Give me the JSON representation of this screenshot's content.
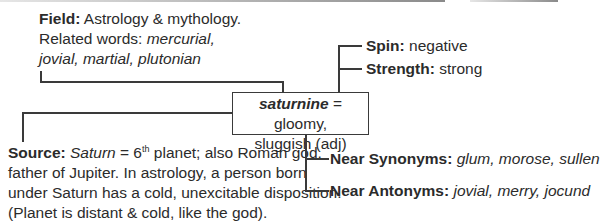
{
  "diagram": {
    "center": {
      "word": "saturnine",
      "equals": " = ",
      "definition_line1": "gloomy,",
      "definition_line2": "sluggish (adj)"
    },
    "field": {
      "label": "Field:",
      "text": " Astrology & mythology.",
      "related_label": "Related words: ",
      "related_line1": "mercurial,",
      "related_line2": "jovial, martial, plutonian"
    },
    "spin": {
      "label": "Spin:",
      "value": " negative"
    },
    "strength": {
      "label": "Strength:",
      "value": " strong"
    },
    "source": {
      "label": "Source:",
      "saturn": "Saturn",
      "eq": " = 6",
      "sup": "th",
      "line1_rest": " planet; also Roman god,",
      "line2": "father of Jupiter. In astrology, a person born",
      "line3": "under Saturn has a cold, unexcitable disposition.",
      "line4": "(Planet is distant & cold, like the god)."
    },
    "near_synonyms": {
      "label": "Near Synonyms:",
      "values": " glum, morose, sullen"
    },
    "near_antonyms": {
      "label": "Near Antonyms:",
      "values": " jovial, merry, jocund"
    }
  }
}
